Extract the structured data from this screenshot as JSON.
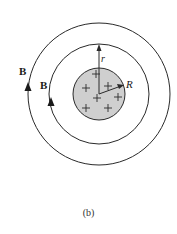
{
  "figure": {
    "caption": "(b)",
    "labels": {
      "field_outer": "B",
      "field_inner": "B",
      "radius_small": "r",
      "radius_large": "R",
      "charge_sign": "+"
    },
    "colors": {
      "line": "#2a2a2a",
      "charged_disk_fill": "#cfcfcf",
      "background": "#ffffff"
    },
    "geometry": {
      "center": [
        99,
        94
      ],
      "outer_loop_radius": 71,
      "inner_loop_radius": 50,
      "charged_disk_radius": 26
    },
    "charges": [
      [
        96,
        74
      ],
      [
        86,
        88
      ],
      [
        108,
        85
      ],
      [
        97,
        98
      ],
      [
        118,
        97
      ],
      [
        86,
        108
      ],
      [
        108,
        108
      ]
    ]
  }
}
